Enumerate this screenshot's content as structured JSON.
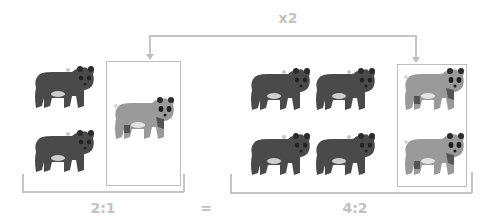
{
  "multiplier": {
    "label": "x2"
  },
  "left_group": {
    "ratio_label": "2:1",
    "dark_bears": 2,
    "light_bears": 1
  },
  "equals": {
    "label": "="
  },
  "right_group": {
    "ratio_label": "4:2",
    "dark_bears": 4,
    "light_bears": 2
  },
  "colors": {
    "dark_bear": "#4a4a4a",
    "light_bear": "#9a9a9a",
    "lines": "#c4c4c4",
    "labels": "#c2c2c2"
  }
}
